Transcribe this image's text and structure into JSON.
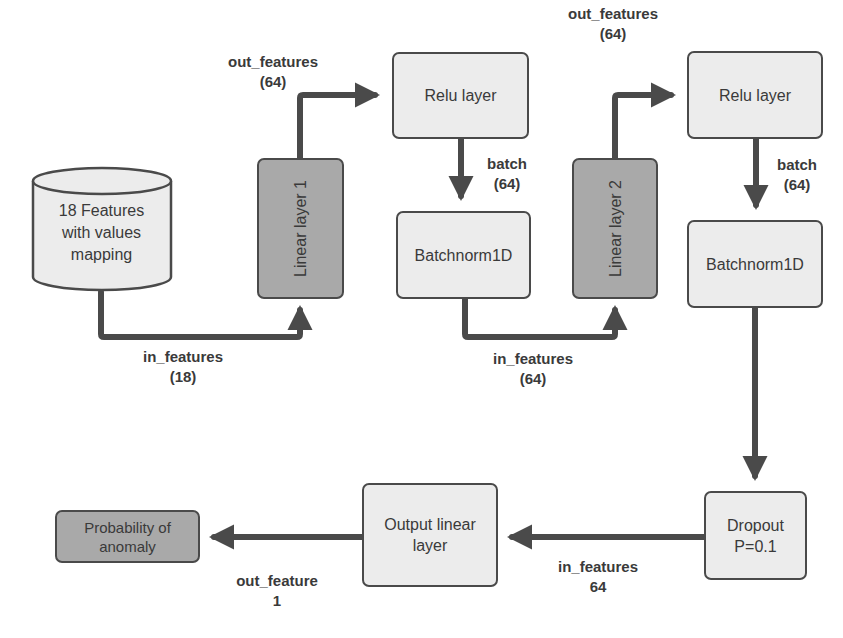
{
  "diagram": {
    "type": "neural-network-architecture",
    "nodes": {
      "input": {
        "label_lines": [
          "18 Features",
          "with values",
          "mapping"
        ],
        "shape": "cylinder"
      },
      "linear1": {
        "label": "Linear layer 1"
      },
      "relu1": {
        "label": "Relu layer"
      },
      "batchnorm1": {
        "label": "Batchnorm1D"
      },
      "linear2": {
        "label": "Linear layer 2"
      },
      "relu2": {
        "label": "Relu layer"
      },
      "batchnorm2": {
        "label": "Batchnorm1D"
      },
      "dropout": {
        "label_lines": [
          "Dropout",
          "P=0.1"
        ]
      },
      "output_linear": {
        "label_lines": [
          "Output linear",
          "layer"
        ]
      },
      "probability": {
        "label_lines": [
          "Probability of",
          "anomaly"
        ]
      }
    },
    "edges": [
      {
        "from": "input",
        "to": "linear1",
        "label_lines": [
          "in_features",
          "(18)"
        ]
      },
      {
        "from": "linear1",
        "to": "relu1",
        "label_lines": [
          "out_features",
          "(64)"
        ]
      },
      {
        "from": "relu1",
        "to": "batchnorm1",
        "label_lines": [
          "batch",
          "(64)"
        ]
      },
      {
        "from": "batchnorm1",
        "to": "linear2",
        "label_lines": [
          "in_features",
          "(64)"
        ]
      },
      {
        "from": "linear2",
        "to": "relu2",
        "label_lines": [
          "out_features",
          "(64)"
        ]
      },
      {
        "from": "relu2",
        "to": "batchnorm2",
        "label_lines": [
          "batch",
          "(64)"
        ]
      },
      {
        "from": "batchnorm2",
        "to": "dropout",
        "label_lines": []
      },
      {
        "from": "dropout",
        "to": "output_linear",
        "label_lines": [
          "in_features",
          "64"
        ]
      },
      {
        "from": "output_linear",
        "to": "probability",
        "label_lines": [
          "out_feature",
          "1"
        ]
      }
    ],
    "colors": {
      "node_fill": "#ececec",
      "linear_fill": "#a9a9a9",
      "output_fill": "#a9a9a9",
      "stroke": "#4a4a4a",
      "text": "#3a3a3a"
    }
  }
}
